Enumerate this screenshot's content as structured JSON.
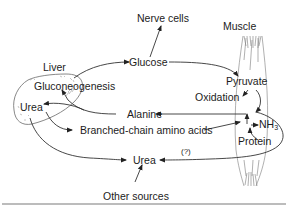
{
  "diagram": {
    "organs": {
      "liver": "Liver",
      "muscle": "Muscle",
      "nerve_cells": "Nerve cells"
    },
    "nodes": {
      "gluconeogenesis": "Gluconeogenesis",
      "urea_liver": "Urea",
      "glucose": "Glucose",
      "pyruvate": "Pyruvate",
      "oxidation": "Oxidation",
      "alanine": "Alanine",
      "nh3_base": "NH",
      "nh3_sub": "3",
      "protein": "Protein",
      "bcaa": "Branched-chain amino acids",
      "urea_bottom": "Urea",
      "uncertain": "(?)",
      "other_sources": "Other sources"
    },
    "edges": [
      {
        "from": "Liver (Gluconeogenesis)",
        "to": "Glucose"
      },
      {
        "from": "Glucose",
        "to": "Nerve cells"
      },
      {
        "from": "Glucose",
        "to": "Pyruvate"
      },
      {
        "from": "Pyruvate",
        "to": "Oxidation"
      },
      {
        "from": "Pyruvate",
        "to": "Alanine"
      },
      {
        "from": "Alanine",
        "to": "Gluconeogenesis"
      },
      {
        "from": "Alanine",
        "to": "Urea (liver)"
      },
      {
        "from": "Liver",
        "to": "Branched-chain amino acids"
      },
      {
        "from": "Branched-chain amino acids",
        "to": "NH3"
      },
      {
        "from": "Protein",
        "to": "NH3"
      },
      {
        "from": "Liver",
        "to": "Urea"
      },
      {
        "from": "Muscle",
        "to": "Urea",
        "label": "(?)"
      },
      {
        "from": "Other sources",
        "to": "Urea"
      }
    ],
    "colors": {
      "line": "#333333",
      "text": "#1c1c1c",
      "organ_outline": "#6a6a6a",
      "rule": "#7a7a7a"
    }
  }
}
